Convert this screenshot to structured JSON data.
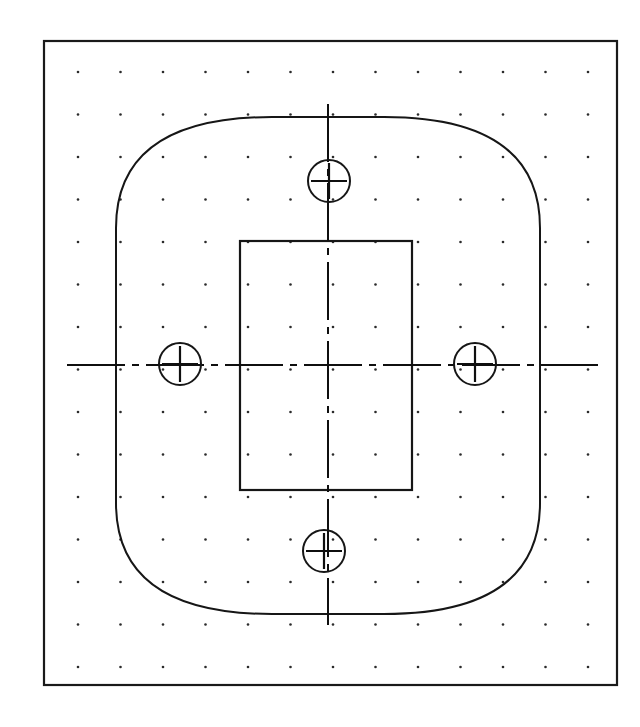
{
  "drawing": {
    "title": "Mounting Plate Plan View",
    "kind": "cad-orthographic-plan",
    "background_color": "#ffffff",
    "line_color": "#161616",
    "dot_color": "#2b2b2b",
    "units": "px"
  },
  "sheet_border": {
    "label": "Drawing sheet border",
    "x": 44,
    "y": 41,
    "width": 573,
    "height": 644,
    "stroke_width": 2.2
  },
  "grid": {
    "label": "Construction dot grid",
    "origin_x": 78,
    "origin_y": 72,
    "spacing_x": 42.5,
    "spacing_y": 42.5,
    "columns": 13,
    "rows": 15,
    "dot_radius": 1.3
  },
  "plate_outline": {
    "label": "Plate outer profile",
    "center_x": 328,
    "center_y": 365,
    "top_y": 117,
    "bottom_y": 614,
    "left_x": 116,
    "right_x": 540,
    "flat_left_top_y": 228,
    "flat_left_bottom_y": 503,
    "flat_right_top_y": 228,
    "flat_right_bottom_y": 503,
    "top_flat_left_x": 272,
    "top_flat_right_x": 384,
    "bottom_flat_left_x": 272,
    "bottom_flat_right_x": 384
  },
  "inner_rectangle": {
    "label": "Inner boss rectangle",
    "x": 240,
    "y": 241,
    "width": 172,
    "height": 249,
    "stroke_width": 2.2
  },
  "centerlines": {
    "label": "Datum centerlines",
    "dash_pattern": "58 7 7 7",
    "horizontal": {
      "y": 365,
      "x_start": 67,
      "x_end": 598
    },
    "vertical": {
      "x": 328,
      "y_start": 104,
      "y_end": 625
    }
  },
  "holes": [
    {
      "name": "hole-top",
      "position": "top",
      "center_x": 329,
      "center_y": 181,
      "radius": 21,
      "center_mark_length": 36
    },
    {
      "name": "hole-right",
      "position": "right",
      "center_x": 475,
      "center_y": 364,
      "radius": 21,
      "center_mark_length": 36
    },
    {
      "name": "hole-bottom",
      "position": "bottom",
      "center_x": 324,
      "center_y": 551,
      "radius": 21,
      "center_mark_length": 36
    },
    {
      "name": "hole-left",
      "position": "left",
      "center_x": 180,
      "center_y": 364,
      "radius": 21,
      "center_mark_length": 36
    }
  ]
}
